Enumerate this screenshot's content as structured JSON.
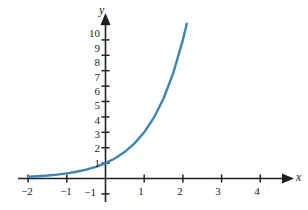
{
  "chart_data": {
    "type": "line",
    "title": "",
    "subtitle": "",
    "xlabel": "x",
    "ylabel": "y",
    "xlim": [
      -2.35,
      4.7
    ],
    "ylim": [
      -1.6,
      11.0
    ],
    "grid": false,
    "legend": null,
    "function": "y = 3^x",
    "series": [
      {
        "name": "exponential curve",
        "color": "#3d85b5",
        "x": [
          -2.0,
          -1.75,
          -1.5,
          -1.25,
          -1.0,
          -0.75,
          -0.5,
          -0.25,
          0.0,
          0.25,
          0.5,
          0.75,
          1.0,
          1.25,
          1.5,
          1.75,
          2.0,
          2.1
        ],
        "y": [
          0.111,
          0.146,
          0.192,
          0.253,
          0.333,
          0.439,
          0.577,
          0.76,
          1.0,
          1.316,
          1.732,
          2.28,
          3.0,
          3.948,
          5.196,
          6.839,
          9.0,
          10.05
        ]
      }
    ],
    "x_axis": {
      "label": "x",
      "tick_values": [
        -2,
        -1,
        1,
        2,
        3,
        4
      ],
      "tick_labels": [
        "−2",
        "−1",
        "1",
        "2",
        "3",
        "4"
      ],
      "arrow": true
    },
    "y_axis": {
      "label": "y",
      "tick_values": [
        -1,
        1,
        2,
        3,
        4,
        5,
        6,
        7,
        8,
        9,
        10
      ],
      "tick_labels": [
        "−1",
        "1",
        "2",
        "3",
        "4",
        "5",
        "6",
        "7",
        "8",
        "9",
        "10"
      ],
      "arrow": true
    }
  },
  "axes": {
    "x_name": "x",
    "y_name": "y"
  },
  "x_ticks": [
    {
      "label": "−2",
      "px": 27
    },
    {
      "label": "−1",
      "px": 66
    },
    {
      "label": "1",
      "px": 141
    },
    {
      "label": "2",
      "px": 180
    },
    {
      "label": "3",
      "px": 218
    },
    {
      "label": "4",
      "px": 257
    }
  ],
  "y_ticks": [
    {
      "label": "10",
      "py": 33
    },
    {
      "label": "9",
      "py": 48
    },
    {
      "label": "8",
      "py": 62
    },
    {
      "label": "7",
      "py": 77
    },
    {
      "label": "6",
      "py": 91
    },
    {
      "label": "5",
      "py": 105
    },
    {
      "label": "4",
      "py": 120
    },
    {
      "label": "3",
      "py": 134
    },
    {
      "label": "2",
      "py": 148
    },
    {
      "label": "1",
      "py": 163
    },
    {
      "label": "−1",
      "py": 192
    }
  ],
  "style": {
    "curve_color": "#3d85b5",
    "axis_color": "#231f20",
    "text_color": "#231f20",
    "background": "#ffffff"
  }
}
